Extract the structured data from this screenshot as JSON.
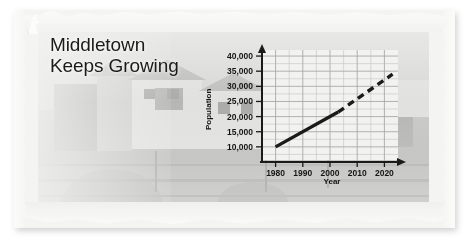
{
  "headline": {
    "line1": "Middletown",
    "line2": "Keeps Growing"
  },
  "chart_data": {
    "type": "line",
    "title": "Middletown Keeps Growing",
    "xlabel": "Year",
    "ylabel": "Population",
    "xlim": [
      1975,
      2025
    ],
    "ylim": [
      5000,
      42000
    ],
    "xticks": [
      "1980",
      "1990",
      "2000",
      "2010",
      "2020"
    ],
    "xtick_values": [
      1980,
      1990,
      2000,
      2010,
      2020
    ],
    "yticks": [
      "10,000",
      "15,000",
      "20,000",
      "25,000",
      "30,000",
      "35,000",
      "40,000"
    ],
    "ytick_values": [
      10000,
      15000,
      20000,
      25000,
      30000,
      35000,
      40000
    ],
    "grid": true,
    "legend": "none",
    "series": [
      {
        "name": "Recorded population",
        "style": "solid",
        "color": "#1a1a1a",
        "x": [
          1980,
          2003
        ],
        "values": [
          10000,
          21500
        ]
      },
      {
        "name": "Projected population",
        "style": "dashed",
        "color": "#1a1a1a",
        "x": [
          2003,
          2023
        ],
        "values": [
          21500,
          34000
        ]
      }
    ],
    "axis_arrows": [
      "x-right",
      "y-up"
    ]
  },
  "colors": {
    "paper": "#f4f4f2",
    "photo_base": "#c9c9c6",
    "ink": "#1a1a1a",
    "plot_background": "#f2f2f0",
    "gridline": "#c2c2bf",
    "gridline_major": "#a9a9a6"
  },
  "icons": {
    "y_axis_arrow": "arrow-up-icon",
    "x_axis_arrow": "arrow-right-icon"
  }
}
